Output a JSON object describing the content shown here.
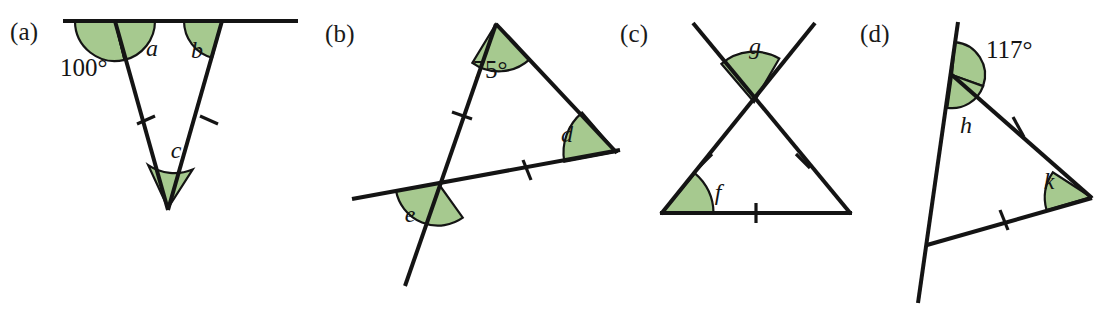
{
  "figure": {
    "background_color": "#ffffff",
    "line_color": "#141414",
    "angle_fill_color": "#a6c98f",
    "angle_stroke_color": "#141414"
  },
  "panels": [
    {
      "key": "a",
      "label": "(a)",
      "description": "Isosceles triangle hanging below a straight horizontal line; exterior angle 100 degrees marked at left vertex.",
      "angles": [
        {
          "name": "exterior-angle-100",
          "text": "100°",
          "kind": "known"
        },
        {
          "name": "angle-a",
          "text": "a",
          "kind": "unknown"
        },
        {
          "name": "angle-b",
          "text": "b",
          "kind": "unknown"
        },
        {
          "name": "angle-c",
          "text": "c",
          "kind": "unknown"
        }
      ],
      "tick_marks": 2
    },
    {
      "key": "b",
      "label": "(b)",
      "description": "Triangle with apex angle 75 degrees; one side extended past the base forming angle e below the intersection.",
      "angles": [
        {
          "name": "apex-angle-75",
          "text": "75°",
          "kind": "known"
        },
        {
          "name": "angle-d",
          "text": "d",
          "kind": "unknown"
        },
        {
          "name": "angle-e",
          "text": "e",
          "kind": "unknown"
        }
      ],
      "tick_marks": 2
    },
    {
      "key": "c",
      "label": "(c)",
      "description": "Two lines crossing above an equilateral-looking triangle; angle g at the crossing point and angle f at the bottom-left vertex.",
      "angles": [
        {
          "name": "angle-g",
          "text": "g",
          "kind": "unknown"
        },
        {
          "name": "angle-f",
          "text": "f",
          "kind": "unknown"
        }
      ],
      "tick_marks": 3
    },
    {
      "key": "d",
      "label": "(d)",
      "description": "Triangle with a side extended upward; exterior angle 117 degrees above, interior angle h below it and angle k at the right vertex.",
      "angles": [
        {
          "name": "exterior-angle-117",
          "text": "117°",
          "kind": "known"
        },
        {
          "name": "angle-h",
          "text": "h",
          "kind": "unknown"
        },
        {
          "name": "angle-k",
          "text": "k",
          "kind": "unknown"
        }
      ],
      "tick_marks": 2
    }
  ]
}
